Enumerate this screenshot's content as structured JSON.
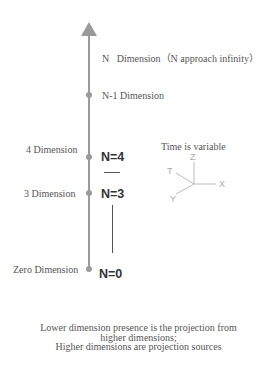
{
  "diagram": {
    "top_label": "N   Dimension（N approach infinity）",
    "levels": [
      {
        "left_label": "N-1 Dimension"
      },
      {
        "left_label": "4 Dimension",
        "n_label": "N=4"
      },
      {
        "left_label": "3 Dimension",
        "n_label": "N=3"
      },
      {
        "left_label": "Zero Dimension",
        "n_label": "N=0"
      }
    ],
    "axes_caption": "Time is variable",
    "axes": {
      "z": "Z",
      "t": "T",
      "x": "X",
      "y": "Y"
    },
    "footer_lines": [
      "Lower dimension presence is the projection from",
      "higher dimensions;",
      "Higher dimensions are projection sources"
    ],
    "colors": {
      "axis": "#9a9a9a",
      "text": "#555555",
      "n_text": "#333333"
    }
  }
}
